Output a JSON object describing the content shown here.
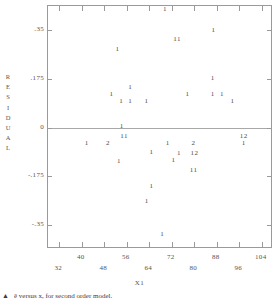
{
  "chart_data": {
    "type": "scatter",
    "title": "",
    "xlabel": "X1",
    "ylabel": "RESIDUAL",
    "xlim": [
      28,
      108
    ],
    "ylim": [
      -0.4375,
      0.4375
    ],
    "grid": false,
    "legend": "none",
    "zero_reference_line": 0,
    "marker_style": "digit-count",
    "xticks": [
      32,
      40,
      48,
      56,
      64,
      72,
      80,
      88,
      96,
      104
    ],
    "xtick_labels": [
      "32",
      "40",
      "48",
      "56",
      "64",
      "72",
      "80",
      "88",
      "96",
      "104"
    ],
    "xtick_label_rows": [
      "b",
      "a",
      "b",
      "a",
      "b",
      "a",
      "b",
      "a",
      "b",
      "a"
    ],
    "yticks": [
      0.35,
      0.175,
      0,
      -0.175,
      -0.35
    ],
    "ytick_labels": [
      ".35",
      ".175",
      "0",
      "-.175",
      "-.35"
    ],
    "ylabel_letters": [
      "R",
      "E",
      "S",
      "I",
      "D",
      "U",
      "A",
      "L"
    ],
    "points": [
      {
        "label": "1",
        "x": 69.6,
        "y": 0.427
      },
      {
        "label": "1",
        "x": 86.8,
        "y": 0.352
      },
      {
        "label": "11",
        "x": 73.9,
        "y": 0.32
      },
      {
        "label": "1",
        "x": 52.7,
        "y": 0.284
      },
      {
        "label": "1",
        "x": 86.6,
        "y": 0.177
      },
      {
        "label": "1",
        "x": 57.2,
        "y": 0.146
      },
      {
        "label": "1",
        "x": 50.6,
        "y": 0.119
      },
      {
        "label": "1",
        "x": 77.6,
        "y": 0.119
      },
      {
        "label": "1",
        "x": 86.6,
        "y": 0.119
      },
      {
        "label": "1",
        "x": 89.9,
        "y": 0.119
      },
      {
        "label": "1",
        "x": 54.0,
        "y": 0.094
      },
      {
        "label": "1",
        "x": 57.2,
        "y": 0.094
      },
      {
        "label": "1",
        "x": 63.0,
        "y": 0.094
      },
      {
        "label": "1",
        "x": 93.6,
        "y": 0.094
      },
      {
        "label": "1",
        "x": 54.2,
        "y": 0.004
      },
      {
        "label": "11",
        "x": 55.1,
        "y": -0.03
      },
      {
        "label": "12",
        "x": 97.6,
        "y": -0.03
      },
      {
        "label": "1",
        "x": 41.8,
        "y": -0.057
      },
      {
        "label": "2",
        "x": 49.3,
        "y": -0.057
      },
      {
        "label": "1",
        "x": 70.6,
        "y": -0.057
      },
      {
        "label": "2",
        "x": 79.7,
        "y": -0.057
      },
      {
        "label": "1",
        "x": 97.6,
        "y": -0.057
      },
      {
        "label": "1",
        "x": 64.8,
        "y": -0.088
      },
      {
        "label": "1",
        "x": 74.6,
        "y": -0.093
      },
      {
        "label": "12",
        "x": 80.1,
        "y": -0.093
      },
      {
        "label": "1",
        "x": 53.2,
        "y": -0.122
      },
      {
        "label": "1",
        "x": 72.6,
        "y": -0.118
      },
      {
        "label": "11",
        "x": 79.8,
        "y": -0.152
      },
      {
        "label": "1",
        "x": 64.8,
        "y": -0.21
      },
      {
        "label": "1",
        "x": 63.1,
        "y": -0.265
      },
      {
        "label": "1",
        "x": 68.6,
        "y": -0.384
      }
    ]
  },
  "caption": {
    "marker": "▲",
    "text": "ê versus x, for second order model."
  }
}
